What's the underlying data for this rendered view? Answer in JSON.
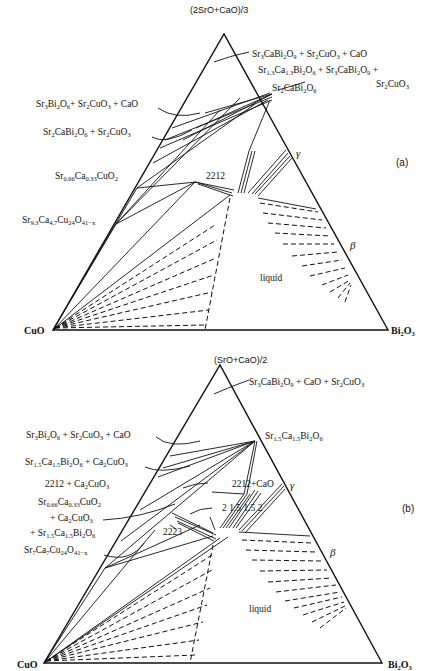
{
  "diagram_a": {
    "panel_label": "(a)",
    "apex_top": "(2SrO+CaO)/3",
    "corner_left": "CuO",
    "corner_right": "Bi2O3",
    "labels": {
      "top_right_1": "Sr3CaBi2O9 + Sr2CuO3 + CaO",
      "top_right_2": "Sr1.3Ca1.3Bi2O6 + Sr3CaBi2O9 +",
      "top_right_2b": "Sr2CuO3",
      "top_right_3": "Sr2CaBi2O6",
      "left_1": "Sr3Bi2O6 + Sr2CuO3 + CaO",
      "left_2": "Sr2CaBi2O6 + Sr2CuO3",
      "left_3": "Sr0.66Ca0.33CuO2",
      "left_4": "Sr9.3Ca4.7Cu24O41-x",
      "phase_2212": "2212",
      "gamma": "γ",
      "beta": "β",
      "liquid": "liquid"
    }
  },
  "diagram_b": {
    "panel_label": "(b)",
    "apex_top": "(SrO+CaO)/2",
    "corner_left": "CuO",
    "corner_right": "Bi2O3",
    "labels": {
      "top_right_1": "Sr3CaBi2O9 + CaO + Sr2CuO3",
      "top_right_2": "Sr1.5Ca1.5Bi2O6",
      "left_1": "Sr3Bi2O6 + Sr2CuO3 + CaO",
      "left_2": "Sr1.5Ca1.5Bi2O6 + Ca2CuO3",
      "left_3": "2212 + Ca2CuO3",
      "left_4": "Sr0.66Ca0.33CuO2",
      "left_5": "+ Ca2CuO3",
      "left_6": "+ Sr1.5Ca1.5Bi2O6",
      "left_7": "Sr7Ca7Cu24O41-x",
      "center_1": "2212+CaO",
      "center_2": "2 1.5 1.5 2",
      "phase_2223": "2223",
      "gamma": "γ",
      "beta": "β",
      "liquid": "liquid"
    }
  }
}
